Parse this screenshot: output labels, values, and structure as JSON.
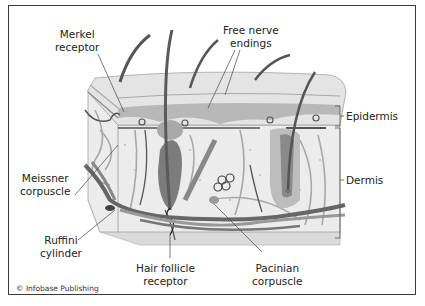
{
  "labels": {
    "merkel": {
      "line1": "Merkel",
      "line2": "receptor"
    },
    "free_nerve": {
      "line1": "Free nerve",
      "line2": "endings"
    },
    "epidermis": "Epidermis",
    "dermis": "Dermis",
    "meissner": {
      "line1": "Meissner",
      "line2": "corpuscle"
    },
    "ruffini": {
      "line1": "Ruffini",
      "line2": "cylinder"
    },
    "hair_follicle": {
      "line1": "Hair follicle",
      "line2": "receptor"
    },
    "pacinian": {
      "line1": "Pacinian",
      "line2": "corpuscle"
    }
  },
  "credit": "© Infobase Publishing",
  "colors": {
    "frame": "#3a3a3a",
    "epidermis_top": "#e2e2e2",
    "epidermis_layer": "#b4b4b4",
    "dermis": "#e8e8e8",
    "hypodermis": "#d8d8d8",
    "nerve_dark": "#555555",
    "nerve_light": "#9a9a9a",
    "hair": "#5a5a5a",
    "follicle": "#8a8a8a"
  }
}
